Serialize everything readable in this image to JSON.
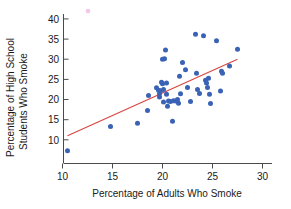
{
  "chart_data": {
    "type": "scatter",
    "title": "",
    "xlabel": "Percentage of Adults Who Smoke",
    "ylabel": "Percentage of High School Students Who Smoke",
    "ylabel_line1": "Percentage of High School",
    "ylabel_line2": "Students Who Smoke",
    "xlim": [
      9.0,
      31.5
    ],
    "ylim": [
      6.0,
      42.5
    ],
    "xticks": [
      10,
      15,
      20,
      25,
      30
    ],
    "yticks": [
      10,
      15,
      20,
      25,
      30,
      35,
      40
    ],
    "xtick_labels": [
      "10",
      "15",
      "20",
      "25",
      "30"
    ],
    "ytick_labels": [
      "10",
      "15",
      "20",
      "25",
      "30",
      "35",
      "40"
    ],
    "grid": false,
    "legend": "none",
    "point_color": "#3a62b5",
    "line_color": "#d8453f",
    "axis_color": "#4a4a4a",
    "series": [
      {
        "name": "States",
        "marker": "circle",
        "points": [
          [
            10.5,
            7.3
          ],
          [
            14.8,
            13.3
          ],
          [
            17.5,
            14.1
          ],
          [
            18.6,
            21.0
          ],
          [
            18.5,
            17.3
          ],
          [
            19.4,
            22.9
          ],
          [
            19.6,
            22.3
          ],
          [
            19.7,
            21.4
          ],
          [
            19.7,
            20.6
          ],
          [
            19.8,
            22.2
          ],
          [
            19.9,
            24.3
          ],
          [
            20.0,
            23.9
          ],
          [
            20.0,
            30.0
          ],
          [
            20.1,
            22.5
          ],
          [
            20.1,
            19.4
          ],
          [
            20.2,
            30.1
          ],
          [
            20.3,
            32.3
          ],
          [
            20.4,
            24.1
          ],
          [
            20.4,
            21.3
          ],
          [
            20.5,
            18.3
          ],
          [
            20.6,
            19.6
          ],
          [
            20.8,
            19.5
          ],
          [
            21.0,
            14.6
          ],
          [
            21.1,
            19.7
          ],
          [
            21.3,
            19.6
          ],
          [
            21.5,
            20.0
          ],
          [
            21.6,
            19.1
          ],
          [
            21.7,
            25.8
          ],
          [
            21.8,
            21.4
          ],
          [
            22.0,
            29.2
          ],
          [
            22.3,
            27.4
          ],
          [
            22.5,
            23.0
          ],
          [
            22.8,
            19.5
          ],
          [
            23.3,
            36.2
          ],
          [
            23.4,
            26.5
          ],
          [
            23.5,
            22.5
          ],
          [
            23.7,
            21.5
          ],
          [
            24.1,
            35.8
          ],
          [
            24.3,
            24.8
          ],
          [
            24.4,
            24.1
          ],
          [
            24.5,
            23.0
          ],
          [
            24.6,
            25.3
          ],
          [
            24.7,
            21.3
          ],
          [
            24.8,
            19.0
          ],
          [
            25.4,
            34.6
          ],
          [
            25.8,
            22.1
          ],
          [
            25.9,
            27.0
          ],
          [
            26.0,
            26.5
          ],
          [
            26.7,
            28.3
          ],
          [
            27.5,
            32.5
          ]
        ]
      }
    ],
    "fit_line": {
      "name": "least-squares regression line",
      "x_start": 10.5,
      "y_start": 11.0,
      "x_end": 27.5,
      "y_end": 30.0
    },
    "artifact": {
      "name": "stray-pink-dot",
      "x_px": 88,
      "y_px": 11
    }
  }
}
